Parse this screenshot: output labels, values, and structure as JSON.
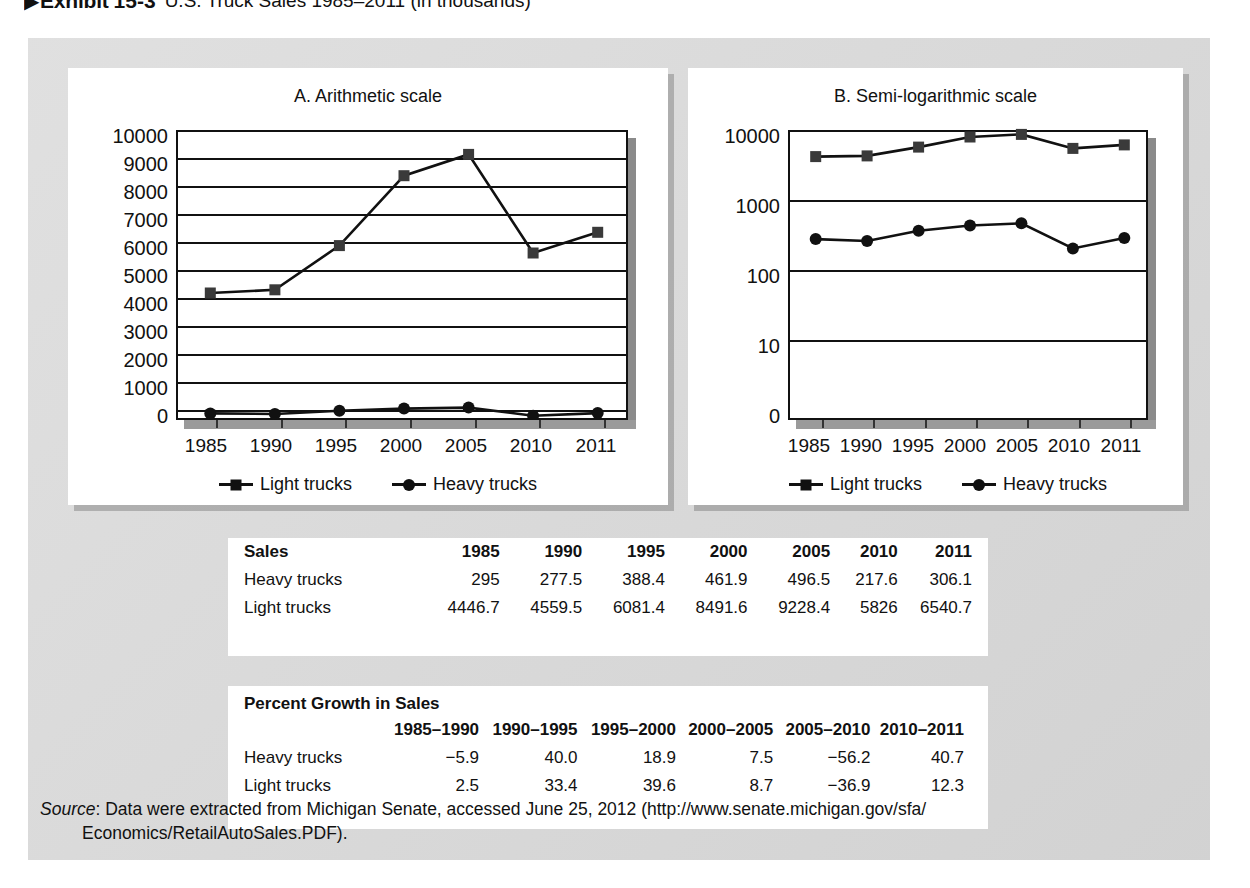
{
  "exhibit": {
    "arrow": "▶",
    "label": "Exhibit",
    "number": "15-3",
    "title": "U.S. Truck Sales 1985–2011 (in thousands)"
  },
  "chart_data": [
    {
      "type": "line",
      "panel": "A",
      "title": "A. Arithmetic scale",
      "xlabel": "",
      "ylabel": "",
      "categories": [
        "1985",
        "1990",
        "1995",
        "2000",
        "2005",
        "2010",
        "2011"
      ],
      "yticks": [
        "0",
        "1000",
        "2000",
        "3000",
        "4000",
        "5000",
        "6000",
        "7000",
        "8000",
        "9000",
        "10000"
      ],
      "ylim": [
        0,
        10000
      ],
      "scale": "linear",
      "grid": true,
      "legend_position": "bottom",
      "series": [
        {
          "name": "Light trucks",
          "marker": "square",
          "values": [
            4446.7,
            4559.5,
            6081.4,
            8491.6,
            9228.4,
            5826,
            6540.7
          ]
        },
        {
          "name": "Heavy trucks",
          "marker": "circle",
          "values": [
            295,
            277.5,
            388.4,
            461.9,
            496.5,
            217.6,
            306.1
          ]
        }
      ]
    },
    {
      "type": "line",
      "panel": "B",
      "title": "B. Semi-logarithmic scale",
      "xlabel": "",
      "ylabel": "",
      "categories": [
        "1985",
        "1990",
        "1995",
        "2000",
        "2005",
        "2010",
        "2011"
      ],
      "yticks": [
        "0",
        "10",
        "100",
        "1000",
        "10000"
      ],
      "ylim": [
        1,
        10000
      ],
      "scale": "log",
      "grid": true,
      "legend_position": "bottom",
      "series": [
        {
          "name": "Light trucks",
          "marker": "square",
          "values": [
            4446.7,
            4559.5,
            6081.4,
            8491.6,
            9228.4,
            5826,
            6540.7
          ]
        },
        {
          "name": "Heavy trucks",
          "marker": "circle",
          "values": [
            295,
            277.5,
            388.4,
            461.9,
            496.5,
            217.6,
            306.1
          ]
        }
      ]
    }
  ],
  "legend": {
    "light": "Light trucks",
    "heavy": "Heavy trucks"
  },
  "sales_table": {
    "corner": "Sales",
    "years": [
      "1985",
      "1990",
      "1995",
      "2000",
      "2005",
      "2010",
      "2011"
    ],
    "rows": [
      {
        "label": "Heavy trucks",
        "values": [
          "295",
          "277.5",
          "388.4",
          "461.9",
          "496.5",
          "217.6",
          "306.1"
        ]
      },
      {
        "label": "Light trucks",
        "values": [
          "4446.7",
          "4559.5",
          "6081.4",
          "8491.6",
          "9228.4",
          "5826",
          "6540.7"
        ]
      }
    ]
  },
  "growth_table": {
    "title": "Percent Growth in Sales",
    "periods": [
      "1985–1990",
      "1990–1995",
      "1995–2000",
      "2000–2005",
      "2005–2010",
      "2010–2011"
    ],
    "rows": [
      {
        "label": "Heavy trucks",
        "values": [
          "−5.9",
          "40.0",
          "18.9",
          "7.5",
          "−56.2",
          "40.7"
        ]
      },
      {
        "label": "Light trucks",
        "values": [
          "2.5",
          "33.4",
          "39.6",
          "8.7",
          "−36.9",
          "12.3"
        ]
      }
    ]
  },
  "source": {
    "label": "Source",
    "line1": ": Data were extracted from Michigan Senate, accessed June 25, 2012 (http://www.senate.michigan.gov/sfa/",
    "line2": "Economics/RetailAutoSales.PDF)."
  },
  "colors": {
    "panel": "#d9d9d9",
    "ink": "#111111",
    "card": "#ffffff",
    "shadow": "#8a8a8a"
  }
}
